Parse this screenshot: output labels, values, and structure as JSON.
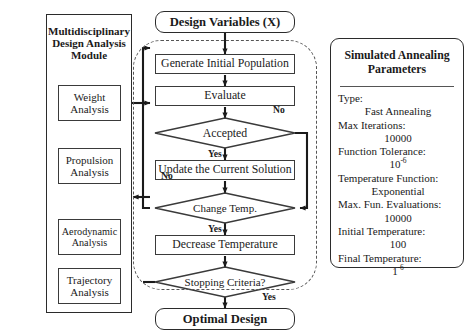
{
  "module": {
    "title_lines": [
      "Multidisciplinary",
      "Design Analysis",
      "Module"
    ],
    "items": [
      {
        "name": "weight-analysis",
        "line1": "Weight",
        "line2": "Analysis"
      },
      {
        "name": "propulsion-analysis",
        "line1": "Propulsion",
        "line2": "Analysis"
      },
      {
        "name": "aerodynamic-analysis",
        "line1": "Aerodynamic",
        "line2": "Analysis"
      },
      {
        "name": "trajectory-analysis",
        "line1": "Trajectory",
        "line2": "Analysis"
      }
    ]
  },
  "flow": {
    "start": "Design Variables (X)",
    "generate": "Generate Initial Population",
    "evaluate": "Evaluate",
    "accepted": "Accepted",
    "update": "Update the Current Solution",
    "change_temp": "Change Temp.",
    "decrease": "Decrease Temperature",
    "stopping": "Stopping Criteria?",
    "end": "Optimal Design",
    "labels": {
      "accepted_no": "No",
      "accepted_yes": "Yes",
      "change_no": "No",
      "change_yes": "Yes",
      "stopping_yes": "Yes"
    }
  },
  "params": {
    "title_lines": [
      "Simulated Annealing",
      "Parameters"
    ],
    "rows": [
      {
        "key": "Type:",
        "value": "Fast Annealing"
      },
      {
        "key": "Max Iterations:",
        "value": "10000"
      },
      {
        "key": "Function Tolerance:",
        "value": "10",
        "sup": "-6"
      },
      {
        "key": "Temperature Function:",
        "value": "Exponential"
      },
      {
        "key": "Max. Fun. Evaluations:",
        "value": "10000"
      },
      {
        "key": "Initial Temperature:",
        "value": "100"
      },
      {
        "key": "Final Temperature:",
        "value": "1",
        "sup": "-6"
      }
    ]
  },
  "colors": {
    "stroke": "#2b2b2b",
    "dash": "#555555",
    "background": "#ffffff"
  }
}
